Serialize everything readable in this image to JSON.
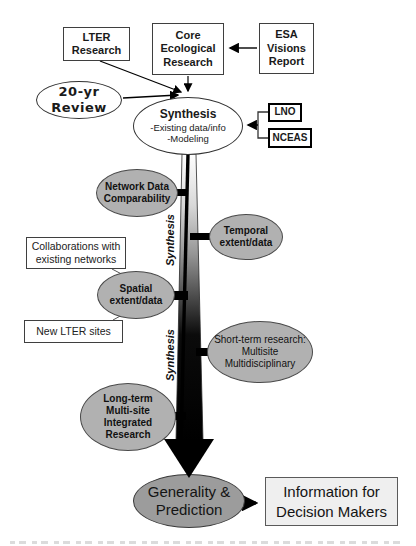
{
  "boxes": {
    "lter": {
      "label": "LTER\nResearch"
    },
    "core": {
      "label": "Core\nEcological\nResearch"
    },
    "esa": {
      "label": "ESA\nVisions\nReport"
    },
    "lno": {
      "label": "LNO"
    },
    "nceas": {
      "label": "NCEAS"
    },
    "collaborations": {
      "label": "Collaborations with\nexisting networks"
    },
    "new_lter_sites": {
      "label": "New LTER sites"
    },
    "info_decision": {
      "label": "Information for\nDecision Makers"
    }
  },
  "ellipses": {
    "review_20yr": {
      "label": "20-yr Review"
    },
    "synthesis": {
      "title": "Synthesis",
      "line1": "-Existing data/info",
      "line2": "-Modeling"
    },
    "network_data": {
      "label": "Network Data\nComparability"
    },
    "temporal": {
      "label": "Temporal\nextent/data"
    },
    "spatial": {
      "label": "Spatial\nextent/data"
    },
    "short_term": {
      "label": "Short-term research:\nMultisite\nMultidisciplinary"
    },
    "long_term": {
      "label": "Long-term\nMulti-site\nIntegrated\nResearch"
    },
    "generality": {
      "label": "Generality &\nPrediction"
    }
  },
  "flow_axis": {
    "label_upper": "Synthesis",
    "label_lower": "Synthesis"
  },
  "colors": {
    "node_gray": "#b1b1b1",
    "generality_gray": "#9c9c9c",
    "info_fill": "#efefef",
    "arrow_black": "#000000"
  }
}
